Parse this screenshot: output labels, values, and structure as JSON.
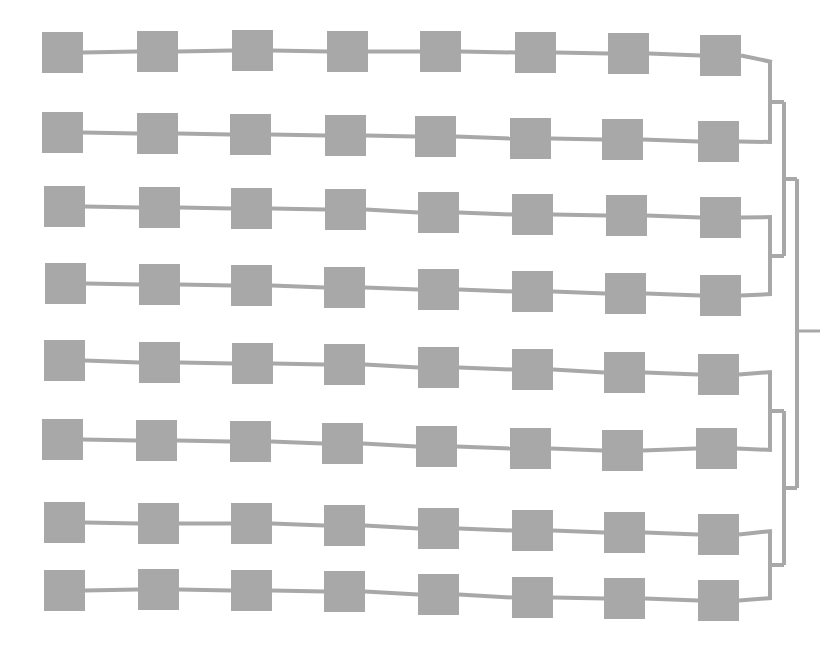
{
  "figure": {
    "type": "dendrogram-with-node-chains",
    "width": 835,
    "height": 656,
    "background_color": "#ffffff",
    "node_fill_color": "#a8a8a8",
    "link_color": "#a8a8a8",
    "branch_color": "#a8a8a8",
    "node_size": 41,
    "link_width": 4,
    "branch_width": 4,
    "row_count": 8,
    "nodes_per_row": 8,
    "total_nodes": 64
  },
  "chart_data": {
    "type": "diagram",
    "title": "",
    "subtitle": "",
    "xlabel": "",
    "ylabel": "",
    "grid": false,
    "legend": null,
    "annotations": [],
    "rows": [
      {
        "id": "row-1",
        "y": 55,
        "squares": [
          {
            "x": 42,
            "y": 32
          },
          {
            "x": 137,
            "y": 31
          },
          {
            "x": 232,
            "y": 30
          },
          {
            "x": 327,
            "y": 31
          },
          {
            "x": 420,
            "y": 31
          },
          {
            "x": 515,
            "y": 32
          },
          {
            "x": 608,
            "y": 33
          },
          {
            "x": 700,
            "y": 35
          }
        ],
        "exit_y": 62
      },
      {
        "id": "row-2",
        "y": 135,
        "squares": [
          {
            "x": 42,
            "y": 112
          },
          {
            "x": 137,
            "y": 113
          },
          {
            "x": 230,
            "y": 114
          },
          {
            "x": 325,
            "y": 115
          },
          {
            "x": 415,
            "y": 116
          },
          {
            "x": 510,
            "y": 118
          },
          {
            "x": 602,
            "y": 119
          },
          {
            "x": 698,
            "y": 121
          }
        ],
        "exit_y": 142
      },
      {
        "id": "row-3",
        "y": 211,
        "squares": [
          {
            "x": 44,
            "y": 186
          },
          {
            "x": 139,
            "y": 187
          },
          {
            "x": 231,
            "y": 188
          },
          {
            "x": 325,
            "y": 189
          },
          {
            "x": 418,
            "y": 192
          },
          {
            "x": 512,
            "y": 194
          },
          {
            "x": 606,
            "y": 195
          },
          {
            "x": 700,
            "y": 197
          }
        ],
        "exit_y": 217
      },
      {
        "id": "row-4",
        "y": 288,
        "squares": [
          {
            "x": 45,
            "y": 263
          },
          {
            "x": 139,
            "y": 264
          },
          {
            "x": 231,
            "y": 265
          },
          {
            "x": 324,
            "y": 267
          },
          {
            "x": 418,
            "y": 269
          },
          {
            "x": 512,
            "y": 271
          },
          {
            "x": 605,
            "y": 273
          },
          {
            "x": 700,
            "y": 275
          }
        ],
        "exit_y": 294
      },
      {
        "id": "row-5",
        "y": 366,
        "squares": [
          {
            "x": 44,
            "y": 340
          },
          {
            "x": 139,
            "y": 342
          },
          {
            "x": 232,
            "y": 343
          },
          {
            "x": 324,
            "y": 344
          },
          {
            "x": 418,
            "y": 347
          },
          {
            "x": 512,
            "y": 349
          },
          {
            "x": 604,
            "y": 352
          },
          {
            "x": 698,
            "y": 354
          }
        ],
        "exit_y": 372
      },
      {
        "id": "row-6",
        "y": 443,
        "squares": [
          {
            "x": 42,
            "y": 419
          },
          {
            "x": 136,
            "y": 420
          },
          {
            "x": 230,
            "y": 421
          },
          {
            "x": 322,
            "y": 423
          },
          {
            "x": 416,
            "y": 426
          },
          {
            "x": 510,
            "y": 428
          },
          {
            "x": 602,
            "y": 430
          },
          {
            "x": 696,
            "y": 428
          }
        ],
        "exit_y": 450
      },
      {
        "id": "row-7",
        "y": 525,
        "squares": [
          {
            "x": 44,
            "y": 502
          },
          {
            "x": 138,
            "y": 503
          },
          {
            "x": 231,
            "y": 503
          },
          {
            "x": 324,
            "y": 505
          },
          {
            "x": 418,
            "y": 508
          },
          {
            "x": 512,
            "y": 510
          },
          {
            "x": 604,
            "y": 512
          },
          {
            "x": 698,
            "y": 514
          }
        ],
        "exit_y": 531
      },
      {
        "id": "row-8",
        "y": 592,
        "squares": [
          {
            "x": 44,
            "y": 570
          },
          {
            "x": 138,
            "y": 569
          },
          {
            "x": 231,
            "y": 570
          },
          {
            "x": 324,
            "y": 571
          },
          {
            "x": 418,
            "y": 574
          },
          {
            "x": 512,
            "y": 577
          },
          {
            "x": 604,
            "y": 578
          },
          {
            "x": 698,
            "y": 580
          }
        ],
        "exit_y": 598
      }
    ],
    "tree": {
      "merges": [
        {
          "id": "merge-1-2",
          "x": 770,
          "y_top": 62,
          "y_bottom": 142,
          "y_mid": 102,
          "children": [
            "row-1",
            "row-2"
          ]
        },
        {
          "id": "merge-3-4",
          "x": 770,
          "y_top": 217,
          "y_bottom": 294,
          "y_mid": 256,
          "children": [
            "row-3",
            "row-4"
          ]
        },
        {
          "id": "merge-5-6",
          "x": 770,
          "y_top": 372,
          "y_bottom": 450,
          "y_mid": 411,
          "children": [
            "row-5",
            "row-6"
          ]
        },
        {
          "id": "merge-7-8",
          "x": 770,
          "y_top": 531,
          "y_bottom": 598,
          "y_mid": 565,
          "children": [
            "row-7",
            "row-8"
          ]
        },
        {
          "id": "merge-top",
          "x": 784,
          "y_top": 102,
          "y_bottom": 256,
          "y_mid": 179,
          "children": [
            "merge-1-2",
            "merge-3-4"
          ]
        },
        {
          "id": "merge-bottom",
          "x": 784,
          "y_top": 411,
          "y_bottom": 565,
          "y_mid": 488,
          "children": [
            "merge-5-6",
            "merge-7-8"
          ]
        },
        {
          "id": "merge-root",
          "x": 797,
          "y_top": 179,
          "y_bottom": 488,
          "y_mid": 331,
          "children": [
            "merge-top",
            "merge-bottom"
          ]
        }
      ],
      "root": {
        "id": "root-stub",
        "x_start": 797,
        "x_end": 820,
        "y": 331
      }
    }
  }
}
